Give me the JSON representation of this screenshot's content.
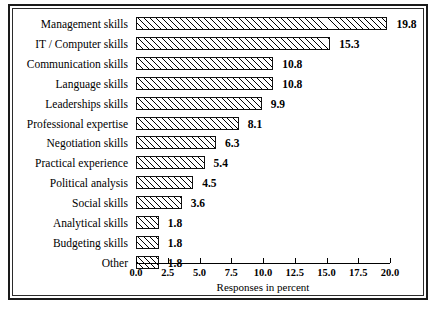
{
  "chart_data": {
    "type": "bar",
    "orientation": "horizontal",
    "title": "",
    "xlabel": "Responses in percent",
    "ylabel": "",
    "xlim": [
      0.0,
      20.0
    ],
    "xticks": [
      "0.0",
      "2.5",
      "5.0",
      "7.5",
      "10.0",
      "12.5",
      "15.0",
      "17.5",
      "20.0"
    ],
    "xtick_values": [
      0.0,
      2.5,
      5.0,
      7.5,
      10.0,
      12.5,
      15.0,
      17.5,
      20.0
    ],
    "grid": false,
    "legend": false,
    "categories": [
      "Management skills",
      "IT / Computer skills",
      "Communication skills",
      "Language skills",
      "Leaderships skills",
      "Professional expertise",
      "Negotiation skills",
      "Practical experience",
      "Political analysis",
      "Social skills",
      "Analytical skills",
      "Budgeting skills",
      "Other"
    ],
    "values": [
      19.8,
      15.3,
      10.8,
      10.8,
      9.9,
      8.1,
      6.3,
      5.4,
      4.5,
      3.6,
      1.8,
      1.8,
      1.8
    ],
    "value_labels": [
      "19.8",
      "15.3",
      "10.8",
      "10.8",
      "9.9",
      "8.1",
      "6.3",
      "5.4",
      "4.5",
      "3.6",
      "1.8",
      "1.8",
      "1.8"
    ],
    "bar_style": {
      "fill": "#ffffff",
      "edge": "#111111",
      "hatch": "forward-diagonal"
    }
  },
  "figure": {
    "background": "#ffffff",
    "frame_color": "#1a1a1a"
  }
}
